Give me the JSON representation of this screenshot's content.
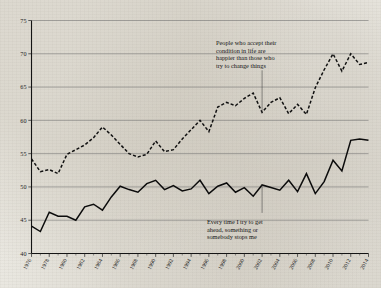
{
  "chart_data": {
    "type": "line",
    "title": "",
    "subtitle": "",
    "xlabel": "",
    "ylabel": "",
    "ylim": [
      40,
      75
    ],
    "xlim": [
      1976,
      2014
    ],
    "yticks": [
      40,
      45,
      50,
      55,
      60,
      65,
      70,
      75
    ],
    "ytick_labels": [
      "40",
      "45",
      "50",
      "55",
      "60",
      "65",
      "70",
      "75"
    ],
    "grid": "horizontal",
    "legend": "none",
    "x": [
      1976,
      1977,
      1978,
      1979,
      1980,
      1981,
      1982,
      1983,
      1984,
      1985,
      1986,
      1987,
      1988,
      1989,
      1990,
      1991,
      1992,
      1993,
      1994,
      1995,
      1996,
      1997,
      1998,
      1999,
      2000,
      2001,
      2002,
      2003,
      2004,
      2005,
      2006,
      2007,
      2008,
      2009,
      2010,
      2011,
      2012,
      2013,
      2014
    ],
    "xtick_labels": [
      "1976",
      "1978",
      "1980",
      "1982",
      "1984",
      "1986",
      "1988",
      "1990",
      "1992",
      "1994",
      "1996",
      "1998",
      "2000",
      "2002",
      "2004",
      "2006",
      "2008",
      "2010",
      "2012",
      "2014"
    ],
    "series": [
      {
        "name": "People who accept their condition in life are happier than those who try to change things",
        "style": "dashed",
        "values": [
          54.2,
          52.3,
          52.6,
          52.0,
          54.9,
          55.6,
          56.3,
          57.4,
          59.0,
          57.8,
          56.4,
          55.0,
          54.5,
          54.9,
          56.9,
          55.3,
          55.6,
          57.2,
          58.6,
          60.0,
          58.3,
          62.0,
          62.7,
          62.2,
          63.3,
          64.1,
          61.2,
          62.7,
          63.4,
          61.0,
          62.4,
          60.9,
          64.9,
          67.6,
          70.0,
          67.4,
          70.0,
          68.4,
          68.7
        ]
      },
      {
        "name": "Every time I try to get ahead, something or somebody stops me",
        "style": "solid",
        "values": [
          44.1,
          43.3,
          46.2,
          45.6,
          45.6,
          45.0,
          47.0,
          47.4,
          46.5,
          48.5,
          50.1,
          49.6,
          49.2,
          50.5,
          51.0,
          49.6,
          50.2,
          49.4,
          49.7,
          51.0,
          49.0,
          50.1,
          50.6,
          49.2,
          49.9,
          48.6,
          50.3,
          49.9,
          49.5,
          51.0,
          49.3,
          52.0,
          49.0,
          50.8,
          54.0,
          52.4,
          57.0,
          57.2,
          57.0
        ]
      }
    ],
    "annotations": [
      {
        "id": "accept-condition",
        "lines": [
          "People who accept their",
          "condition in life are",
          "happier than those who",
          "try to change things"
        ],
        "points_to_series": "People who accept their condition in life are happier than those who try to change things",
        "points_to_x": 2002
      },
      {
        "id": "try-to-get-ahead",
        "lines": [
          "Every time I try to get",
          "ahead, something or",
          "somebody stops me"
        ],
        "points_to_series": "Every time I try to get ahead, something or somebody stops me",
        "points_to_x": 2002
      }
    ],
    "colors": {
      "background": "#eeece6",
      "line": "#101010",
      "grid": "#6e6e6e",
      "axis": "#141414",
      "text": "#1b1b1b"
    }
  }
}
